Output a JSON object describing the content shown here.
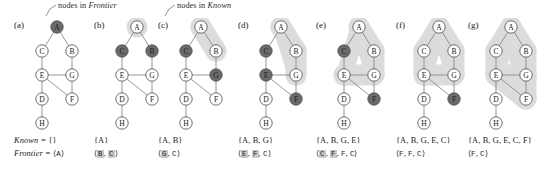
{
  "annotations": [
    {
      "name": "frontier-annotation",
      "text": "nodes in Frontier",
      "italic_word": "Frontier",
      "x": 46,
      "y": 2
    },
    {
      "name": "known-annotation",
      "text": "nodes in Known",
      "italic_word": "Known",
      "x": 163,
      "y": 2
    }
  ],
  "legend": {
    "frontier_prefix": "nodes in ",
    "frontier_term": "Frontier",
    "known_prefix": "nodes in ",
    "known_term": "Known"
  },
  "graph": {
    "nodes": [
      "A",
      "B",
      "C",
      "D",
      "E",
      "F",
      "G",
      "H"
    ],
    "edges": [
      [
        "A",
        "C"
      ],
      [
        "A",
        "B"
      ],
      [
        "C",
        "E"
      ],
      [
        "B",
        "G"
      ],
      [
        "E",
        "G"
      ],
      [
        "E",
        "F"
      ],
      [
        "G",
        "F"
      ],
      [
        "E",
        "D"
      ],
      [
        "D",
        "H"
      ]
    ],
    "node_positions": {
      "A": [
        33,
        9
      ],
      "C": [
        18,
        33
      ],
      "B": [
        48,
        33
      ],
      "E": [
        18,
        57
      ],
      "G": [
        48,
        57
      ],
      "D": [
        18,
        81
      ],
      "F": [
        48,
        81
      ],
      "H": [
        18,
        105
      ]
    }
  },
  "colors": {
    "frontier_node_fill": "#6b6b6b",
    "known_node_fill": "#ffffff",
    "known_region_fill": "#d6d6d6",
    "node_stroke": "#4a4a4a",
    "edge_stroke": "#8a8a8a",
    "text": "#1a1a1a",
    "highlight_bg": "#c9c9c9"
  },
  "panels": [
    {
      "id": "a",
      "label": "(a)",
      "x": 14,
      "frontier_nodes": [
        "A"
      ],
      "known_nodes": [],
      "known_label_prefix": "Known = ",
      "known_set": "{}",
      "frontier_label_prefix": "Frontier = ",
      "frontier_seq": "⟨A⟩",
      "frontier_tokens": [
        {
          "text": "A",
          "highlight": false
        }
      ],
      "show_label_prefix": true
    },
    {
      "id": "b",
      "label": "(b)",
      "x": 94,
      "frontier_nodes": [
        "B",
        "C"
      ],
      "known_nodes": [
        "A"
      ],
      "known_set": "{A}",
      "frontier_tokens": [
        {
          "text": "B",
          "highlight": true
        },
        {
          "text": "C",
          "highlight": true
        }
      ],
      "show_label_prefix": false
    },
    {
      "id": "c",
      "label": "(c)",
      "x": 158,
      "frontier_nodes": [
        "C",
        "G"
      ],
      "known_nodes": [
        "A",
        "B"
      ],
      "known_set": "{A, B}",
      "frontier_tokens": [
        {
          "text": "G",
          "highlight": true
        },
        {
          "text": "C",
          "highlight": false
        }
      ],
      "show_label_prefix": false
    },
    {
      "id": "d",
      "label": "(d)",
      "x": 238,
      "frontier_nodes": [
        "C",
        "E",
        "F"
      ],
      "known_nodes": [
        "A",
        "B",
        "G"
      ],
      "known_set": "{A, B, G}",
      "frontier_tokens": [
        {
          "text": "E",
          "highlight": true
        },
        {
          "text": "F",
          "highlight": true
        },
        {
          "text": "C",
          "highlight": false
        }
      ],
      "show_label_prefix": false
    },
    {
      "id": "e",
      "label": "(e)",
      "x": 316,
      "frontier_nodes": [
        "C",
        "F"
      ],
      "known_nodes": [
        "A",
        "B",
        "G",
        "E"
      ],
      "known_set": "{A, B, G, E}",
      "frontier_tokens": [
        {
          "text": "C",
          "highlight": true
        },
        {
          "text": "F",
          "highlight": true
        },
        {
          "text": "F",
          "highlight": false
        },
        {
          "text": "C",
          "highlight": false
        }
      ],
      "show_label_prefix": false
    },
    {
      "id": "f",
      "label": "(f)",
      "x": 396,
      "frontier_nodes": [
        "F"
      ],
      "known_nodes": [
        "A",
        "B",
        "G",
        "E",
        "C"
      ],
      "known_set": "{A, B, G, E, C}",
      "frontier_tokens": [
        {
          "text": "F",
          "highlight": false
        },
        {
          "text": "F",
          "highlight": false
        },
        {
          "text": "C",
          "highlight": false
        }
      ],
      "show_label_prefix": false
    },
    {
      "id": "g",
      "label": "(g)",
      "x": 468,
      "frontier_nodes": [],
      "known_nodes": [
        "A",
        "B",
        "G",
        "E",
        "C",
        "F"
      ],
      "known_set": "{A, B, G, E, C, F}",
      "frontier_tokens": [
        {
          "text": "F",
          "highlight": false
        },
        {
          "text": "C",
          "highlight": false
        }
      ],
      "show_label_prefix": false
    }
  ],
  "caption_text": {
    "known_prefix": "Known = ",
    "frontier_prefix": "Frontier = ",
    "open_angle": "⟨",
    "close_angle": "⟩",
    "comma": ", "
  }
}
